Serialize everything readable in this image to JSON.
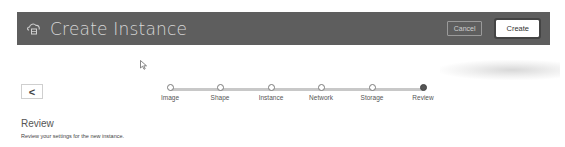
{
  "header": {
    "title": "Create Instance",
    "icon": "cloud-instance-icon",
    "cancel_label": "Cancel",
    "create_label": "Create"
  },
  "back_button": {
    "label": "<",
    "icon": "chevron-left-icon"
  },
  "stepper": {
    "steps": [
      {
        "label": "Image",
        "state": "complete"
      },
      {
        "label": "Shape",
        "state": "complete"
      },
      {
        "label": "Instance",
        "state": "complete"
      },
      {
        "label": "Network",
        "state": "complete"
      },
      {
        "label": "Storage",
        "state": "complete"
      },
      {
        "label": "Review",
        "state": "current"
      }
    ]
  },
  "section": {
    "title": "Review",
    "description": "Review your settings for the new instance."
  },
  "colors": {
    "header_bg": "#5e5e5e",
    "header_text": "#d8d8d8",
    "active_step": "#555555",
    "track": "#c8c8c8"
  }
}
